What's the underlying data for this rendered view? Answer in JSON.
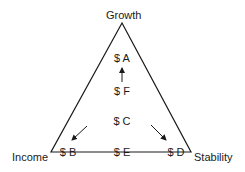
{
  "vertices": {
    "top": "Growth",
    "left": "Income",
    "right": "Stability"
  },
  "nodes": [
    {
      "id": "A",
      "label": "$ A"
    },
    {
      "id": "F",
      "label": "$ F"
    },
    {
      "id": "C",
      "label": "$ C"
    },
    {
      "id": "B",
      "label": "$ B"
    },
    {
      "id": "E",
      "label": "$ E"
    },
    {
      "id": "D",
      "label": "$ D"
    }
  ],
  "arrows": [
    {
      "from": "F",
      "to": "A",
      "direction": "up"
    },
    {
      "from": "C",
      "to": "B",
      "direction": "down-left"
    },
    {
      "from": "C",
      "to": "D",
      "direction": "down-right"
    }
  ],
  "colors": {
    "stroke": "#1a1a1a",
    "background": "#ffffff"
  }
}
